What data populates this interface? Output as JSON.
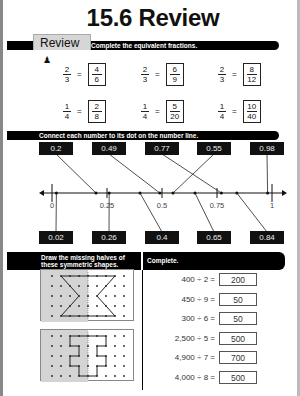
{
  "title": "15.6 Review",
  "review_tab": {
    "label": "Review",
    "icon": "person-icon"
  },
  "section1": {
    "instruction": "Complete the equivalent fractions.",
    "fractions": [
      {
        "left": {
          "num": "2",
          "den": "3"
        },
        "answer": {
          "num": "4",
          "den": "6"
        }
      },
      {
        "left": {
          "num": "2",
          "den": "3"
        },
        "answer": {
          "num": "6",
          "den": "9"
        }
      },
      {
        "left": {
          "num": "2",
          "den": "3"
        },
        "answer": {
          "num": "8",
          "den": "12"
        }
      },
      {
        "left": {
          "num": "1",
          "den": "4"
        },
        "answer": {
          "num": "2",
          "den": "8"
        }
      },
      {
        "left": {
          "num": "1",
          "den": "4"
        },
        "answer": {
          "num": "5",
          "den": "20"
        }
      },
      {
        "left": {
          "num": "1",
          "den": "4"
        },
        "answer": {
          "num": "10",
          "den": "40"
        }
      }
    ],
    "equals": "="
  },
  "section2": {
    "instruction": "Connect each number to its dot on the number line.",
    "top_numbers": [
      "0.2",
      "0.49",
      "0.77",
      "0.55",
      "0.98"
    ],
    "bottom_numbers": [
      "0.02",
      "0.26",
      "0.4",
      "0.65",
      "0.84"
    ],
    "tick_labels": [
      "0",
      "0.25",
      "0.5",
      "0.75",
      "1"
    ],
    "number_values_top": [
      0.2,
      0.49,
      0.77,
      0.55,
      0.98
    ],
    "number_values_bottom": [
      0.02,
      0.26,
      0.4,
      0.65,
      0.84
    ]
  },
  "section3": {
    "instruction_line1": "Draw the missing halves of",
    "instruction_line2": "these symmetric shapes."
  },
  "section4": {
    "instruction": "Complete.",
    "rows": [
      {
        "expr": "400 ÷ 2 =",
        "answer": "200"
      },
      {
        "expr": "450 ÷ 9 =",
        "answer": "50"
      },
      {
        "expr": "300 ÷ 6 =",
        "answer": "50"
      },
      {
        "expr": "2,500 ÷ 5 =",
        "answer": "500"
      },
      {
        "expr": "4,900 ÷ 7 =",
        "answer": "700"
      },
      {
        "expr": "4,000 ÷ 8 =",
        "answer": "500"
      }
    ]
  }
}
